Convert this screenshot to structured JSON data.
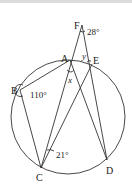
{
  "diagram": {
    "type": "circle-geometry",
    "points": {
      "F": {
        "label": "F",
        "x": 82,
        "y": 25
      },
      "A": {
        "label": "A",
        "x": 70,
        "y": 60
      },
      "E": {
        "label": "E",
        "x": 92,
        "y": 64
      },
      "B": {
        "label": "B",
        "x": 20,
        "y": 90
      },
      "C": {
        "label": "C",
        "x": 41,
        "y": 168
      },
      "D": {
        "label": "D",
        "x": 107,
        "y": 160
      }
    },
    "circle": {
      "cx": 68,
      "cy": 117,
      "r": 57
    },
    "segments": [
      "F-C",
      "F-D",
      "A-B",
      "B-C",
      "A-D",
      "C-E"
    ],
    "angles": {
      "F": "28°",
      "B": "110°",
      "C": "21°",
      "x": "x",
      "y": "y"
    }
  }
}
